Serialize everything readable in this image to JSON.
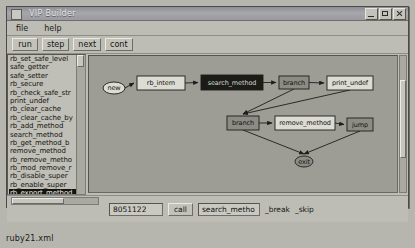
{
  "desktop": {
    "file_label": "ruby21.xml"
  },
  "window": {
    "title": "VIP Builder",
    "icon": "app-icon",
    "buttons": {
      "minimize": "minimize-icon",
      "maximize": "maximize-icon",
      "close": "close-icon"
    }
  },
  "menubar": {
    "items": [
      {
        "label": "file"
      },
      {
        "label": "help"
      }
    ]
  },
  "toolbar": {
    "buttons": [
      {
        "label": "run"
      },
      {
        "label": "step"
      },
      {
        "label": "next"
      },
      {
        "label": "cont"
      }
    ]
  },
  "function_list": {
    "selected_index": 16,
    "items": [
      {
        "label": "rb_set_safe_level"
      },
      {
        "label": "safe_getter"
      },
      {
        "label": "safe_setter"
      },
      {
        "label": "rb_secure"
      },
      {
        "label": "rb_check_safe_str"
      },
      {
        "label": "print_undef"
      },
      {
        "label": "rb_clear_cache"
      },
      {
        "label": "rb_clear_cache_by"
      },
      {
        "label": "rb_add_method"
      },
      {
        "label": "search_method"
      },
      {
        "label": "rb_get_method_b"
      },
      {
        "label": "remove_method"
      },
      {
        "label": "rb_remove_metho"
      },
      {
        "label": "rb_mod_remove_r"
      },
      {
        "label": "rb_disable_super"
      },
      {
        "label": "rb_enable_super"
      },
      {
        "label": "rb_export_method"
      },
      {
        "label": "rb_method_bound"
      }
    ]
  },
  "graph": {
    "nodes": [
      {
        "id": "entry",
        "label": "new",
        "shape": "ellipse",
        "style": "normal"
      },
      {
        "id": "n1",
        "label": "rb_intern",
        "shape": "box",
        "style": "normal"
      },
      {
        "id": "n2",
        "label": "search_method",
        "shape": "box",
        "style": "selected"
      },
      {
        "id": "n3",
        "label": "branch",
        "shape": "box",
        "style": "shaded"
      },
      {
        "id": "n4",
        "label": "print_undef",
        "shape": "box",
        "style": "normal"
      },
      {
        "id": "n5",
        "label": "branch",
        "shape": "box",
        "style": "shaded"
      },
      {
        "id": "n6",
        "label": "remove_method",
        "shape": "box",
        "style": "normal"
      },
      {
        "id": "n7",
        "label": "jump",
        "shape": "box",
        "style": "shaded"
      },
      {
        "id": "exit",
        "label": "exit",
        "shape": "ellipse",
        "style": "shaded"
      }
    ],
    "edges": [
      {
        "from": "entry",
        "to": "n1"
      },
      {
        "from": "n1",
        "to": "n2"
      },
      {
        "from": "n2",
        "to": "n3"
      },
      {
        "from": "n3",
        "to": "n4"
      },
      {
        "from": "n3",
        "to": "n5"
      },
      {
        "from": "n5",
        "to": "n6"
      },
      {
        "from": "n6",
        "to": "n7"
      },
      {
        "from": "n5",
        "to": "exit"
      },
      {
        "from": "n7",
        "to": "exit"
      },
      {
        "from": "n4",
        "to": "n5"
      }
    ]
  },
  "statusbar": {
    "address_value": "8051122",
    "call_label": "call",
    "symbol_value": "search_metho",
    "break_label": "_break",
    "skip_label": "_skip"
  }
}
